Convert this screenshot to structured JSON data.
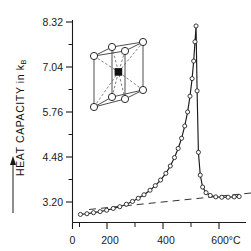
{
  "figure": {
    "name": "heat-capacity-vs-temperature",
    "yaxis_title": "HEAT  CAPACITY  in k",
    "yaxis_title_subscript": "B",
    "yaxis_arrow": "upward-arrow",
    "inset_name": "body-centered-cubic-unit-cell",
    "line_color": "#1a1a1a",
    "marker_face": "#ffffff",
    "background": "#ffffff"
  },
  "chart_data": {
    "type": "line",
    "title": "",
    "xlabel": "",
    "ylabel": "HEAT CAPACITY in kB",
    "xlim": [
      0,
      660
    ],
    "ylim": [
      2.55,
      8.32
    ],
    "grid": false,
    "legend": "none",
    "x_unit": "°C",
    "x_ticks": [
      0,
      200,
      400,
      600
    ],
    "x_tick_labels": [
      "0",
      "200",
      "400",
      "600°C"
    ],
    "x_minor_ticks": [
      100,
      300,
      500
    ],
    "y_ticks": [
      3.2,
      4.48,
      5.76,
      7.04,
      8.32
    ],
    "y_tick_labels": [
      "3.20",
      "4.48",
      "5.76",
      "7.04",
      "8.32"
    ],
    "y_minor_ticks": [
      3.84,
      5.12,
      6.4,
      7.68
    ],
    "peak_temperature": 470,
    "peak_value": 8.15,
    "series": [
      {
        "name": "measured heat capacity",
        "marker": "open-circle",
        "x": [
          30,
          55,
          80,
          105,
          130,
          155,
          180,
          205,
          228,
          250,
          272,
          295,
          315,
          335,
          355,
          372,
          388,
          402,
          415,
          427,
          438,
          447,
          455,
          461,
          466,
          470,
          474,
          479,
          486,
          495,
          508,
          524,
          545,
          568,
          592,
          615,
          634
        ],
        "y": [
          2.78,
          2.8,
          2.83,
          2.86,
          2.9,
          2.95,
          3.0,
          3.07,
          3.15,
          3.24,
          3.34,
          3.47,
          3.6,
          3.76,
          3.95,
          4.16,
          4.4,
          4.66,
          4.95,
          5.3,
          5.7,
          6.15,
          6.65,
          7.15,
          7.7,
          8.15,
          6.3,
          4.55,
          3.9,
          3.56,
          3.4,
          3.32,
          3.28,
          3.27,
          3.27,
          3.28,
          3.29
        ]
      },
      {
        "name": "lattice baseline",
        "style": "dashed",
        "x": [
          60,
          640
        ],
        "y": [
          2.72,
          3.24
        ]
      }
    ]
  },
  "inset": {
    "label": "bcc-unit-cell-diagram",
    "corner_atoms": 8,
    "center_atom": 1,
    "center_atom_style": "filled-square",
    "corner_atom_style": "open-circle"
  }
}
